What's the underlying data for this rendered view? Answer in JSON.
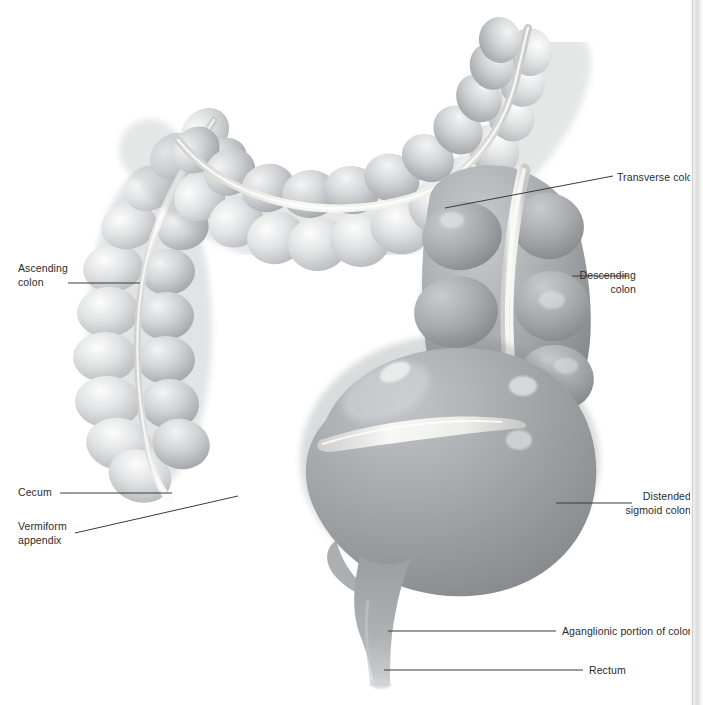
{
  "figure": {
    "background_color": "#ffffff",
    "label_color": "#2b2b2b",
    "leader_color": "#3a3a3a",
    "tissue_light": "#d9dadb",
    "tissue_mid": "#a9acae",
    "tissue_dark": "#8e9295",
    "taenia_color": "#f2f2f0"
  },
  "labels": [
    {
      "id": "transverse-colon",
      "text": "Transverse colon",
      "align": "left",
      "x": 617,
      "y": 171
    },
    {
      "id": "descending-colon",
      "text": "Descending\ncolon",
      "align": "right",
      "x": 636,
      "y": 269
    },
    {
      "id": "ascending-colon",
      "text": "Ascending\ncolon",
      "align": "left",
      "x": 18,
      "y": 262
    },
    {
      "id": "cecum",
      "text": "Cecum",
      "align": "left",
      "x": 18,
      "y": 486
    },
    {
      "id": "vermiform-appendix",
      "text": "Vermiform\nappendix",
      "align": "left",
      "x": 18,
      "y": 520
    },
    {
      "id": "distended-sigmoid",
      "text": "Distended\nsigmoid colon",
      "align": "right",
      "x": 691,
      "y": 497
    },
    {
      "id": "aganglionic",
      "text": "Aganglionic portion of colon",
      "align": "left",
      "x": 562,
      "y": 625
    },
    {
      "id": "rectum",
      "text": "Rectum",
      "align": "left",
      "x": 589,
      "y": 664
    }
  ],
  "anatomy_parts": [
    "transverse colon",
    "descending colon",
    "ascending colon",
    "cecum",
    "vermiform appendix",
    "distended sigmoid colon",
    "aganglionic portion of colon",
    "rectum"
  ]
}
